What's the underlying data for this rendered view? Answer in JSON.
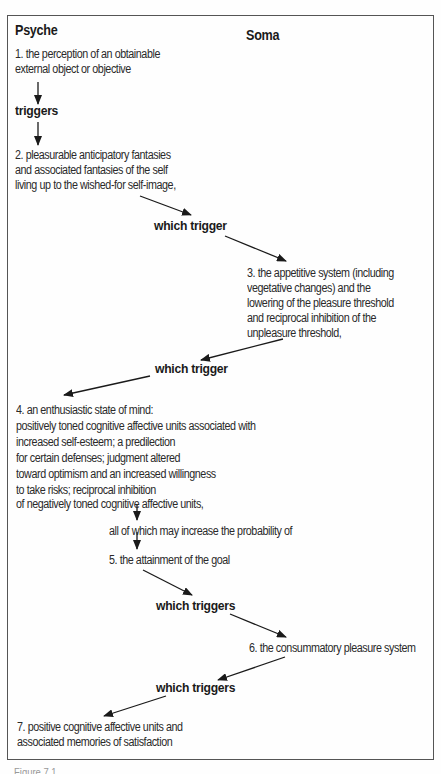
{
  "columns": {
    "left": "Psyche",
    "right": "Soma"
  },
  "steps": [
    {
      "number": "1",
      "lines": [
        "1. the perception of an obtainable",
        "external object or objective"
      ]
    },
    {
      "number": "2",
      "lines": [
        "2. pleasurable anticipatory fantasies",
        "and associated fantasies of the self",
        "living up to the wished-for self-image,"
      ]
    },
    {
      "number": "3",
      "lines": [
        "3. the appetitive system (including",
        "vegetative changes) and the",
        "lowering of the pleasure threshold",
        "and reciprocal inhibition of the",
        "unpleasure threshold,"
      ]
    },
    {
      "number": "4",
      "lines": [
        "4. an enthusiastic state of mind:",
        "positively toned cognitive affective units associated with",
        "increased self-esteem; a predilection",
        "for certain defenses; judgment altered",
        "toward optimism and an increased willingness",
        "to take risks; reciprocal inhibition",
        "of negatively toned cognitive affective units,"
      ]
    },
    {
      "number": "5",
      "lines": [
        "5. the attainment of the goal"
      ]
    },
    {
      "number": "6",
      "lines": [
        "6. the consummatory pleasure system"
      ]
    },
    {
      "number": "7",
      "lines": [
        "7. positive cognitive affective units and",
        "associated memories of satisfaction"
      ]
    }
  ],
  "connectors": {
    "c1": "triggers",
    "c2": "which trigger",
    "c3": "which trigger",
    "c4": "all of which may increase the probability of",
    "c5": "which triggers",
    "c6": "which triggers"
  },
  "caption": "Figure 7.1"
}
